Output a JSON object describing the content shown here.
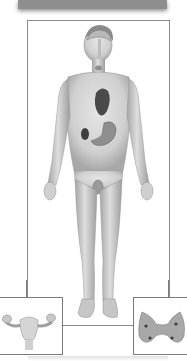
{
  "diagram": {
    "header_bar": {
      "text": "",
      "color": "#8e8e8e"
    },
    "main_figure": {
      "depicts": "male-human-body",
      "visible_organs": [
        "brain",
        "pituitary",
        "thyroid",
        "heart",
        "kidney",
        "stomach",
        "testes"
      ],
      "frame_color": "#8a8a8a"
    },
    "insets": [
      {
        "position": "bottom-left",
        "depicts": "female-reproductive-organs"
      },
      {
        "position": "bottom-right",
        "depicts": "thyroid-gland"
      }
    ],
    "colors": {
      "skin": "#d9d9d9",
      "skin_shadow": "#a9a9a9",
      "organ_dark": "#4a4a4a",
      "background": "#ffffff"
    }
  }
}
